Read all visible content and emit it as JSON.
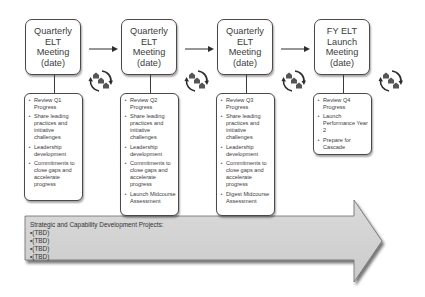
{
  "diagram": {
    "meetings": [
      {
        "title_lines": [
          "Quarterly",
          "ELT Meeting",
          "(date)"
        ],
        "items": [
          "Review Q1 Progress",
          "Share leading practices and initiative challenges",
          "Leadership development",
          "Commitments to close gaps and accelerate progress"
        ]
      },
      {
        "title_lines": [
          "Quarterly",
          "ELT Meeting",
          "(date)"
        ],
        "items": [
          "Review Q2 Progress",
          "Share leading practices and initiative challenges",
          "Leadership development",
          "Commitments to close gaps and accelerate progress",
          "Launch Midcourse Assessment"
        ]
      },
      {
        "title_lines": [
          "Quarterly",
          "ELT Meeting",
          "(date)"
        ],
        "items": [
          "Review Q3 Progress",
          "Share leading practices and initiative challenges",
          "Leadership development",
          "Commitments to close gaps and accelerate progress",
          "Digest Midcourse Assessment"
        ]
      },
      {
        "title_lines": [
          "FY ELT",
          "Launch",
          "Meeting",
          "(date)"
        ],
        "items": [
          "Review Q4 Progress",
          "Launch Performance Year 2",
          "Prepare for Cascade"
        ]
      }
    ],
    "cycle_icon": "cycle-houses-icon",
    "projects": {
      "heading": "Strategic and Capability Development Projects:",
      "items": [
        "(TBD)",
        "(TBD)",
        "(TBD)",
        "(TBD)"
      ]
    },
    "colors": {
      "arrow_fill": "#d2d2d2",
      "arrow_stroke": "#6a6a6a",
      "box_border": "#4a4a4a",
      "house_fill": "#555555",
      "text": "#3c3c3c"
    }
  }
}
